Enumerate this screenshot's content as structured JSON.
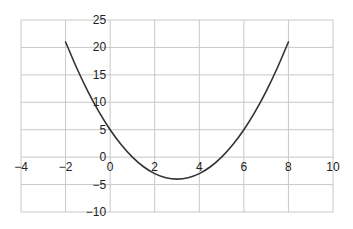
{
  "chart_data": {
    "type": "line",
    "title": "",
    "xlabel": "",
    "ylabel": "",
    "xlim": [
      -4,
      10
    ],
    "ylim": [
      -10,
      25
    ],
    "x_ticks": [
      -4,
      -2,
      0,
      2,
      4,
      6,
      8,
      10
    ],
    "y_ticks": [
      -10,
      -5,
      0,
      5,
      10,
      15,
      20,
      25
    ],
    "x_tick_labels": [
      "−4",
      "−2",
      "0",
      "2",
      "4",
      "6",
      "8",
      "10"
    ],
    "y_tick_labels": [
      "−10",
      "−5",
      "0",
      "5",
      "10",
      "15",
      "20",
      "25"
    ],
    "grid": true,
    "legend": null,
    "series": [
      {
        "name": "y = (x − 3)² − 4",
        "color": "#333333",
        "x": [
          -2,
          -1.5,
          -1,
          -0.5,
          0,
          0.5,
          1,
          1.5,
          2,
          2.5,
          3,
          3.5,
          4,
          4.5,
          5,
          5.5,
          6,
          6.5,
          7,
          7.5,
          8
        ],
        "y": [
          21,
          16.25,
          12,
          8.25,
          5,
          2.25,
          0,
          -1.75,
          -3,
          -3.75,
          -4,
          -3.75,
          -3,
          -1.75,
          0,
          2.25,
          5,
          8.25,
          12,
          16.25,
          21
        ]
      }
    ]
  },
  "colors": {
    "grid": "#c8c8c8",
    "curve": "#333333",
    "text": "#222222",
    "background": "#ffffff"
  }
}
